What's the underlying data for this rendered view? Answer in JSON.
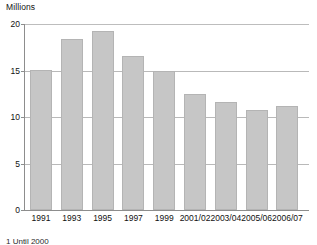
{
  "chart_data": {
    "type": "bar",
    "title": "",
    "subtitle": "",
    "xlabel": "",
    "ylabel": "Millions",
    "ylim": [
      0,
      20
    ],
    "yticks": [
      0,
      5,
      10,
      15,
      20
    ],
    "ytick_labels": [
      "0",
      "5",
      "10",
      "15",
      "20"
    ],
    "grid": true,
    "grid_axis": "y",
    "legend": false,
    "legend_position": "none",
    "categories": [
      "1991",
      "1993",
      "1995",
      "1997",
      "1999",
      "2001/02",
      "2003/04",
      "2005/06",
      "2006/07"
    ],
    "values": [
      15.1,
      18.4,
      19.3,
      16.6,
      14.9,
      12.5,
      11.6,
      10.8,
      11.2
    ],
    "bar_color": "#c6c6c6",
    "bar_edge_color": "#b4b4b4",
    "axis_color": "#8d8d8d",
    "gridline_color": "#b9b9b9",
    "annotations": []
  },
  "axis": {
    "unit_label": "Millions"
  },
  "footnote": {
    "text": "1 Until 2000"
  }
}
